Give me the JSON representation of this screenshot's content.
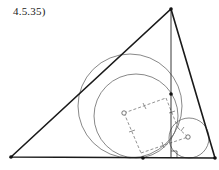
{
  "figure": {
    "label": "4.5.35)",
    "colors": {
      "triangle": "#1a1a1a",
      "circle": "#666666",
      "dashed": "#777777",
      "point": "#111111"
    },
    "triangle": {
      "A": [
        11,
        157
      ],
      "B": [
        171,
        9
      ],
      "C": [
        215,
        158
      ]
    },
    "altitude": {
      "from": [
        171,
        9
      ],
      "foot": [
        171,
        158
      ]
    },
    "circles": [
      {
        "name": "outer-large",
        "cx": 130,
        "cy": 106,
        "r": 52
      },
      {
        "name": "inner-large",
        "cx": 136,
        "cy": 116,
        "r": 42
      },
      {
        "name": "small",
        "cx": 189,
        "cy": 138,
        "r": 20
      }
    ],
    "points": [
      {
        "name": "altitude-point",
        "x": 171,
        "y": 94
      },
      {
        "name": "base-point",
        "x": 143,
        "y": 158
      }
    ],
    "open_markers": [
      {
        "name": "large-center",
        "x": 124,
        "y": 113
      },
      {
        "name": "small-center",
        "x": 188,
        "y": 137
      }
    ]
  }
}
